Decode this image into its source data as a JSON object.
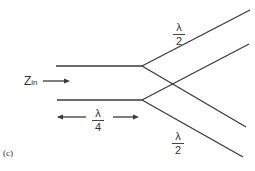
{
  "diagram": {
    "panel_label": "(c)",
    "input_label": "Z",
    "input_label_sub": "in",
    "feed_length": {
      "numerator": "λ",
      "denominator": "4"
    },
    "branch_top": {
      "numerator": "λ",
      "denominator": "2"
    },
    "branch_bottom": {
      "numerator": "λ",
      "denominator": "2"
    },
    "line_color": "#3a3a3a"
  }
}
